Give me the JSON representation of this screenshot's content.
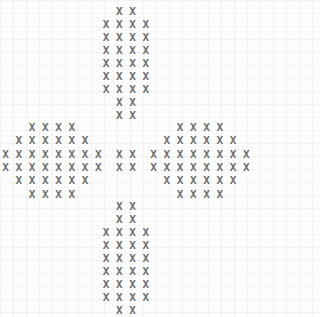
{
  "pattern": {
    "glyph": "X",
    "text_color": "#6e6e6e",
    "top": [
      "X X",
      "X X X X",
      "X X X X",
      "X X X X",
      "X X X X",
      "X X X X",
      "X X X X",
      "X X",
      "X X"
    ],
    "left": [
      "X X X X",
      "X X X X X X",
      "X X X X X X X X",
      "X X X X X X X X",
      "X X X X X X",
      "X X X X"
    ],
    "center": [
      "",
      "",
      "X X",
      "X X",
      "",
      ""
    ],
    "right": [
      "X X X X",
      "X X X X X X",
      "X X X X X X X X",
      "X X X X X X X X",
      "X X X X X X",
      "X X X X"
    ],
    "bottom": [
      "X X",
      "X X",
      "X X X X",
      "X X X X",
      "X X X X",
      "X X X X",
      "X X X X",
      "X X X X",
      "X X"
    ]
  }
}
